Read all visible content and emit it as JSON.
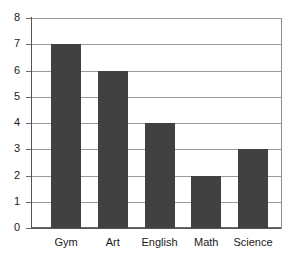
{
  "chart_data": {
    "type": "bar",
    "title": "",
    "subtitle": "",
    "xlabel": "",
    "ylabel": "",
    "categories": [
      "Gym",
      "Art",
      "English",
      "Math",
      "Science"
    ],
    "values": [
      7,
      6,
      4,
      2,
      3
    ],
    "series": [
      {
        "name": "",
        "values": [
          7,
          6,
          4,
          2,
          3
        ]
      }
    ],
    "ylim": [
      0,
      8
    ],
    "y_ticks": [
      0,
      1,
      2,
      3,
      4,
      5,
      6,
      7,
      8
    ],
    "y_tick_labels": [
      "0",
      "1",
      "2",
      "3",
      "4",
      "5",
      "6",
      "7",
      "8"
    ],
    "grid": true,
    "grid_axis": "y",
    "legend": false,
    "legend_position": "none",
    "annotations": []
  },
  "style": {
    "bar_color": "#414141",
    "grid_color": "#9a9a9a",
    "axis_color": "#555555",
    "text_color": "#1a1a1a",
    "background_color": "#ffffff"
  }
}
